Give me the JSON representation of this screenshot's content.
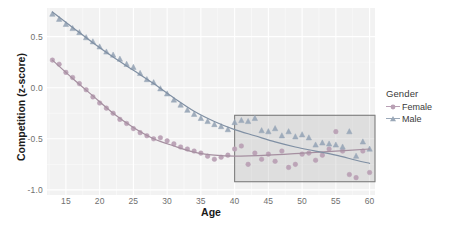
{
  "chart_data": {
    "type": "scatter",
    "title": "",
    "xlabel": "Age",
    "ylabel": "Competition (z-score)",
    "xlim": [
      12.2,
      60.8
    ],
    "ylim": [
      -1.05,
      0.78
    ],
    "xticks": [
      15,
      20,
      25,
      30,
      35,
      40,
      45,
      50,
      55,
      60
    ],
    "yticks": [
      0.5,
      0.0,
      -0.5,
      -1.0
    ],
    "ytick_labels": [
      "0.5",
      "0.0",
      "-0.5",
      "-1.0"
    ],
    "grid": true,
    "legend": {
      "title": "Gender",
      "position": "right",
      "entries": [
        {
          "label": "Female",
          "color": "#b9a0b4",
          "marker": "circle"
        },
        {
          "label": "Male",
          "color": "#9aa8b8",
          "marker": "triangle"
        }
      ]
    },
    "annotations": [
      {
        "type": "rect",
        "name": "highlight-region",
        "x0": 40.0,
        "x1": 60.8,
        "y0": -0.92,
        "y1": -0.27,
        "fill": "#969696",
        "border": "#7d7d7d"
      }
    ],
    "series": [
      {
        "name": "Female",
        "marker": "circle",
        "color": "#b9a0b4",
        "line_color": "#a58fa0",
        "points": [
          {
            "x": 13,
            "y": 0.27
          },
          {
            "x": 14,
            "y": 0.23
          },
          {
            "x": 15,
            "y": 0.15
          },
          {
            "x": 16,
            "y": 0.1
          },
          {
            "x": 17,
            "y": 0.04
          },
          {
            "x": 18,
            "y": -0.02
          },
          {
            "x": 19,
            "y": -0.09
          },
          {
            "x": 20,
            "y": -0.15
          },
          {
            "x": 21,
            "y": -0.2
          },
          {
            "x": 22,
            "y": -0.25
          },
          {
            "x": 23,
            "y": -0.31
          },
          {
            "x": 24,
            "y": -0.35
          },
          {
            "x": 25,
            "y": -0.4
          },
          {
            "x": 26,
            "y": -0.44
          },
          {
            "x": 27,
            "y": -0.47
          },
          {
            "x": 28,
            "y": -0.5
          },
          {
            "x": 29,
            "y": -0.49
          },
          {
            "x": 30,
            "y": -0.52
          },
          {
            "x": 31,
            "y": -0.55
          },
          {
            "x": 32,
            "y": -0.58
          },
          {
            "x": 33,
            "y": -0.6
          },
          {
            "x": 34,
            "y": -0.62
          },
          {
            "x": 35,
            "y": -0.64
          },
          {
            "x": 36,
            "y": -0.67
          },
          {
            "x": 37,
            "y": -0.7
          },
          {
            "x": 38,
            "y": -0.68
          },
          {
            "x": 39,
            "y": -0.66
          },
          {
            "x": 40,
            "y": -0.6
          },
          {
            "x": 41,
            "y": -0.57
          },
          {
            "x": 42,
            "y": -0.75
          },
          {
            "x": 43,
            "y": -0.64
          },
          {
            "x": 44,
            "y": -0.7
          },
          {
            "x": 45,
            "y": -0.65
          },
          {
            "x": 46,
            "y": -0.72
          },
          {
            "x": 47,
            "y": -0.62
          },
          {
            "x": 48,
            "y": -0.78
          },
          {
            "x": 49,
            "y": -0.75
          },
          {
            "x": 50,
            "y": -0.65
          },
          {
            "x": 51,
            "y": -0.64
          },
          {
            "x": 52,
            "y": -0.71
          },
          {
            "x": 53,
            "y": -0.66
          },
          {
            "x": 54,
            "y": -0.6
          },
          {
            "x": 55,
            "y": -0.43
          },
          {
            "x": 56,
            "y": -0.62
          },
          {
            "x": 57,
            "y": -0.85
          },
          {
            "x": 58,
            "y": -0.88
          },
          {
            "x": 59,
            "y": -0.62
          },
          {
            "x": 60,
            "y": -0.83
          }
        ],
        "fit_line": [
          {
            "x": 13,
            "y": 0.27
          },
          {
            "x": 16,
            "y": 0.09
          },
          {
            "x": 19,
            "y": -0.08
          },
          {
            "x": 22,
            "y": -0.25
          },
          {
            "x": 25,
            "y": -0.39
          },
          {
            "x": 28,
            "y": -0.5
          },
          {
            "x": 31,
            "y": -0.57
          },
          {
            "x": 34,
            "y": -0.63
          },
          {
            "x": 37,
            "y": -0.66
          },
          {
            "x": 40,
            "y": -0.67
          },
          {
            "x": 45,
            "y": -0.66
          },
          {
            "x": 50,
            "y": -0.64
          },
          {
            "x": 55,
            "y": -0.62
          },
          {
            "x": 60,
            "y": -0.6
          }
        ]
      },
      {
        "name": "Male",
        "marker": "triangle",
        "color": "#9aa8b8",
        "line_color": "#7f8fa3",
        "points": [
          {
            "x": 13,
            "y": 0.72
          },
          {
            "x": 14,
            "y": 0.67
          },
          {
            "x": 15,
            "y": 0.62
          },
          {
            "x": 16,
            "y": 0.58
          },
          {
            "x": 17,
            "y": 0.54
          },
          {
            "x": 18,
            "y": 0.49
          },
          {
            "x": 19,
            "y": 0.45
          },
          {
            "x": 20,
            "y": 0.4
          },
          {
            "x": 21,
            "y": 0.35
          },
          {
            "x": 22,
            "y": 0.32
          },
          {
            "x": 23,
            "y": 0.28
          },
          {
            "x": 24,
            "y": 0.23
          },
          {
            "x": 25,
            "y": 0.2
          },
          {
            "x": 26,
            "y": 0.14
          },
          {
            "x": 27,
            "y": 0.08
          },
          {
            "x": 28,
            "y": 0.05
          },
          {
            "x": 29,
            "y": -0.01
          },
          {
            "x": 30,
            "y": -0.06
          },
          {
            "x": 31,
            "y": -0.12
          },
          {
            "x": 32,
            "y": -0.17
          },
          {
            "x": 33,
            "y": -0.22
          },
          {
            "x": 34,
            "y": -0.26
          },
          {
            "x": 35,
            "y": -0.3
          },
          {
            "x": 36,
            "y": -0.33
          },
          {
            "x": 37,
            "y": -0.36
          },
          {
            "x": 38,
            "y": -0.38
          },
          {
            "x": 39,
            "y": -0.41
          },
          {
            "x": 40,
            "y": -0.34
          },
          {
            "x": 41,
            "y": -0.32
          },
          {
            "x": 42,
            "y": -0.33
          },
          {
            "x": 43,
            "y": -0.3
          },
          {
            "x": 44,
            "y": -0.42
          },
          {
            "x": 45,
            "y": -0.43
          },
          {
            "x": 46,
            "y": -0.4
          },
          {
            "x": 47,
            "y": -0.47
          },
          {
            "x": 48,
            "y": -0.43
          },
          {
            "x": 49,
            "y": -0.48
          },
          {
            "x": 50,
            "y": -0.46
          },
          {
            "x": 51,
            "y": -0.49
          },
          {
            "x": 52,
            "y": -0.56
          },
          {
            "x": 53,
            "y": -0.54
          },
          {
            "x": 54,
            "y": -0.55
          },
          {
            "x": 55,
            "y": -0.56
          },
          {
            "x": 56,
            "y": -0.58
          },
          {
            "x": 57,
            "y": -0.43
          },
          {
            "x": 58,
            "y": -0.67
          },
          {
            "x": 59,
            "y": -0.53
          },
          {
            "x": 60,
            "y": -0.6
          }
        ],
        "fit_line": [
          {
            "x": 13,
            "y": 0.74
          },
          {
            "x": 16,
            "y": 0.59
          },
          {
            "x": 19,
            "y": 0.44
          },
          {
            "x": 22,
            "y": 0.3
          },
          {
            "x": 25,
            "y": 0.17
          },
          {
            "x": 28,
            "y": 0.04
          },
          {
            "x": 31,
            "y": -0.1
          },
          {
            "x": 34,
            "y": -0.23
          },
          {
            "x": 37,
            "y": -0.33
          },
          {
            "x": 40,
            "y": -0.41
          },
          {
            "x": 43,
            "y": -0.47
          },
          {
            "x": 46,
            "y": -0.53
          },
          {
            "x": 49,
            "y": -0.58
          },
          {
            "x": 52,
            "y": -0.62
          },
          {
            "x": 55,
            "y": -0.66
          },
          {
            "x": 58,
            "y": -0.71
          },
          {
            "x": 60,
            "y": -0.74
          }
        ]
      }
    ]
  },
  "panel": {
    "background": "#f2f2f2",
    "grid_color": "#ffffff"
  }
}
